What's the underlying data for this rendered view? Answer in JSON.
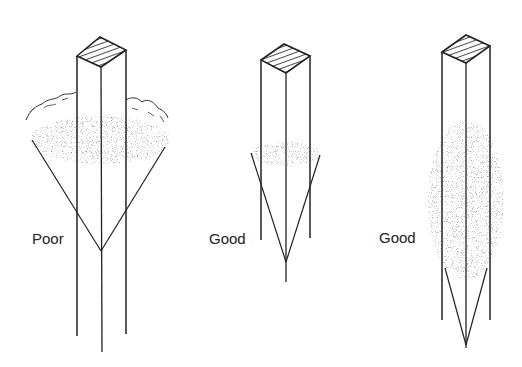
{
  "diagram": {
    "type": "post-installation-comparison",
    "posts": [
      {
        "id": "post-1",
        "label": "Poor",
        "description": "Shallow fill at surface; pointed tip below the compacted zone"
      },
      {
        "id": "post-2",
        "label": "Good",
        "description": "Narrow compacted band near mid-height; sharp point extends below post"
      },
      {
        "id": "post-3",
        "label": "Good",
        "description": "Deep tall compacted zone around post; point at bottom"
      }
    ]
  },
  "colors": {
    "ink": "#222222",
    "stipple": "#555555",
    "background": "#ffffff"
  }
}
